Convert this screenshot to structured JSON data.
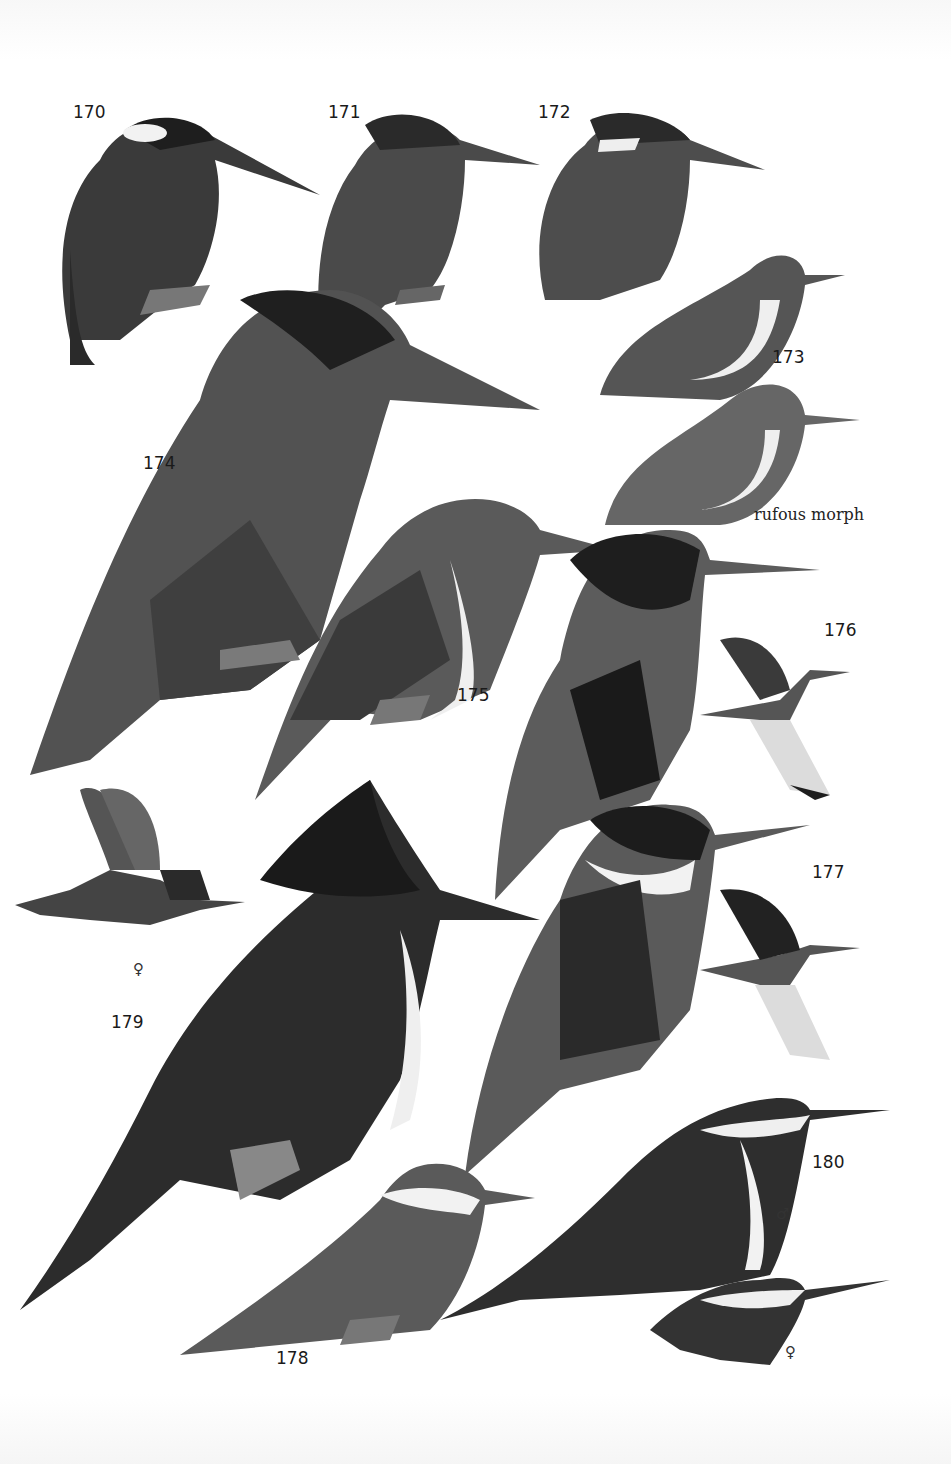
{
  "plate": {
    "subject": "Kingfishers field guide plate",
    "labels": [
      {
        "id": "170",
        "text": "170"
      },
      {
        "id": "171",
        "text": "171"
      },
      {
        "id": "172",
        "text": "172"
      },
      {
        "id": "173",
        "text": "173"
      },
      {
        "id": "174",
        "text": "174"
      },
      {
        "id": "175",
        "text": "175"
      },
      {
        "id": "176",
        "text": "176"
      },
      {
        "id": "177",
        "text": "177"
      },
      {
        "id": "178",
        "text": "178"
      },
      {
        "id": "179",
        "text": "179"
      },
      {
        "id": "180",
        "text": "180"
      }
    ],
    "annotations": {
      "rufous_morph": "rufous morph",
      "female_179": "♀",
      "male_180": "♂",
      "female_180": "♀"
    },
    "colors": {
      "background": "#ffffff",
      "dark": "#1e1e1e",
      "mid": "#555555",
      "light": "#8a8a8a",
      "white": "#f7f7f7"
    }
  }
}
